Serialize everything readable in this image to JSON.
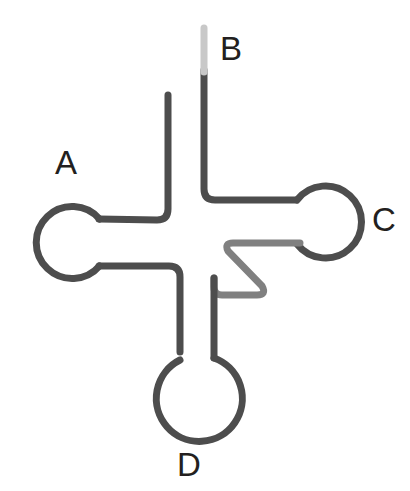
{
  "figure": {
    "background_color": "#ffffff",
    "width": 410,
    "height": 491
  },
  "labels": [
    {
      "id": "A",
      "text": "A",
      "x": 55,
      "y": 146,
      "font_size": 33,
      "color": "#231f20"
    },
    {
      "id": "B",
      "text": "B",
      "x": 220,
      "y": 32,
      "font_size": 33,
      "color": "#231f20"
    },
    {
      "id": "C",
      "text": "C",
      "x": 372,
      "y": 203,
      "font_size": 33,
      "color": "#231f20"
    },
    {
      "id": "D",
      "text": "D",
      "x": 177,
      "y": 448,
      "font_size": 33,
      "color": "#231f20"
    }
  ],
  "colors": {
    "stroke_dark": "#4d4d4d",
    "stroke_mid": "#808080",
    "stroke_light": "#c8c8c8",
    "label": "#231f20",
    "background": "#ffffff"
  },
  "stroke": {
    "width": 7,
    "linecap": "round",
    "linejoin": "round"
  },
  "chart_data": {
    "type": "diagram",
    "elements": [
      {
        "name": "arm-A",
        "label": "A",
        "role": "left-loop-arm",
        "loop": {
          "shape": "circle",
          "cx": 63,
          "cy": 234,
          "r": 36
        },
        "stems": [
          {
            "from": [
              99,
              220
            ],
            "to": [
              168,
              220
            ],
            "orientation": "horizontal",
            "shade": "dark"
          },
          {
            "from": [
              99,
              265
            ],
            "to": [
              180,
              265
            ],
            "orientation": "horizontal",
            "shade": "dark"
          }
        ]
      },
      {
        "name": "arm-B",
        "label": "B",
        "role": "acceptor-stem-open-end",
        "stems": [
          {
            "from": [
              168,
              95
            ],
            "to": [
              168,
              215
            ],
            "orientation": "vertical",
            "shade": "dark",
            "note": "left strand, free end at top"
          },
          {
            "from": [
              204,
              28
            ],
            "to": [
              204,
              195
            ],
            "orientation": "vertical",
            "shade": "dark",
            "note": "right strand, free end at top fading to light gray"
          }
        ],
        "tip": {
          "from": [
            204,
            28
          ],
          "to": [
            204,
            72
          ],
          "shade": "light",
          "color": "#c8c8c8"
        }
      },
      {
        "name": "arm-C",
        "label": "C",
        "role": "right-loop-arm",
        "loop": {
          "shape": "circle",
          "cx": 330,
          "cy": 221,
          "r": 36
        },
        "stems": [
          {
            "from": [
              204,
              200
            ],
            "to": [
              297,
              200
            ],
            "orientation": "horizontal",
            "shade": "dark"
          },
          {
            "from": [
              232,
              243
            ],
            "to": [
              297,
              243
            ],
            "orientation": "horizontal",
            "shade": "mid"
          }
        ]
      },
      {
        "name": "arm-D",
        "label": "D",
        "role": "bottom-loop-arm",
        "loop": {
          "shape": "circle",
          "cx": 187,
          "cy": 398,
          "r": 43
        },
        "stems": [
          {
            "from": [
              180,
              265
            ],
            "to": [
              180,
              360
            ],
            "orientation": "vertical",
            "shade": "dark"
          },
          {
            "from": [
              214,
              280
            ],
            "to": [
              214,
              358
            ],
            "orientation": "vertical",
            "shade": "dark"
          }
        ]
      },
      {
        "name": "variable-loop-zigzag",
        "role": "central-zigzag",
        "shade": "mid",
        "color": "#808080",
        "points": [
          [
            297,
            243
          ],
          [
            232,
            243
          ],
          [
            265,
            295
          ],
          [
            214,
            295
          ],
          [
            214,
            280
          ]
        ]
      },
      {
        "name": "central-junction",
        "role": "four-way-junction",
        "center": [
          196,
          240
        ]
      }
    ],
    "legend": [
      {
        "key": "A",
        "meaning": "Left circular loop arm"
      },
      {
        "key": "B",
        "meaning": "Top open-ended double strand"
      },
      {
        "key": "C",
        "meaning": "Right circular loop arm"
      },
      {
        "key": "D",
        "meaning": "Bottom circular loop arm"
      }
    ]
  }
}
